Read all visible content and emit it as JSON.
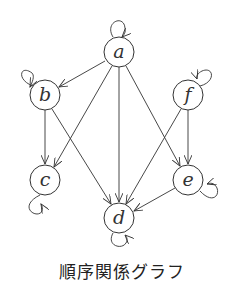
{
  "diagram": {
    "type": "directed-graph",
    "caption": "順序関係グラフ",
    "colors": {
      "stroke": "#333333",
      "background": "#ffffff"
    },
    "nodes": [
      {
        "id": "a",
        "label": "a",
        "x": 119,
        "y": 52
      },
      {
        "id": "b",
        "label": "b",
        "x": 45,
        "y": 95
      },
      {
        "id": "f",
        "label": "f",
        "x": 188,
        "y": 95
      },
      {
        "id": "c",
        "label": "c",
        "x": 45,
        "y": 180
      },
      {
        "id": "e",
        "label": "e",
        "x": 188,
        "y": 180
      },
      {
        "id": "d",
        "label": "d",
        "x": 119,
        "y": 218
      }
    ],
    "edges": [
      {
        "from": "a",
        "to": "b"
      },
      {
        "from": "a",
        "to": "c"
      },
      {
        "from": "a",
        "to": "d"
      },
      {
        "from": "a",
        "to": "e"
      },
      {
        "from": "b",
        "to": "c"
      },
      {
        "from": "b",
        "to": "d"
      },
      {
        "from": "f",
        "to": "d"
      },
      {
        "from": "f",
        "to": "e"
      },
      {
        "from": "e",
        "to": "d"
      }
    ],
    "self_loops": [
      "a",
      "b",
      "c",
      "d",
      "e",
      "f"
    ]
  }
}
